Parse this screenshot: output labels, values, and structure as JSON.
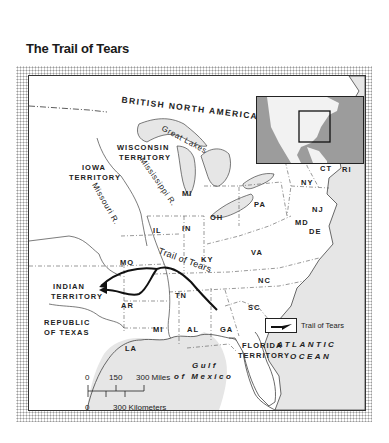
{
  "title": "The Trail of Tears",
  "inset_map": {
    "description": "North America locator map",
    "highlight": "Eastern United States"
  },
  "labels": {
    "country": "BRITISH NORTH AMERICA",
    "great_lakes": "Great Lakes",
    "wisconsin_1": "WISCONSIN",
    "wisconsin_2": "TERRITORY",
    "iowa_1": "IOWA",
    "iowa_2": "TERRITORY",
    "mississippi_river": "Mississippi R.",
    "missouri_river": "Missouri R.",
    "indian_1": "INDIAN",
    "indian_2": "TERRITORY",
    "texas_1": "REPUBLIC",
    "texas_2": "OF TEXAS",
    "florida_1": "FLORIDA",
    "florida_2": "TERRITORY",
    "atlantic_1": "ATLANTIC",
    "atlantic_2": "OCEAN",
    "gulf_1": "Gulf",
    "gulf_2": "of Mexico",
    "trail": "Trail of Tears"
  },
  "states": [
    "ME",
    "VT",
    "NH",
    "MA",
    "RI",
    "CT",
    "NY",
    "NJ",
    "PA",
    "DE",
    "MD",
    "MI",
    "OH",
    "IN",
    "IL",
    "MO",
    "KY",
    "VA",
    "NC",
    "TN",
    "SC",
    "GA",
    "AL",
    "MI",
    "AR",
    "LA"
  ],
  "legend": {
    "label": "Trail of Tears",
    "symbol": "arrow-line"
  },
  "scale": {
    "miles": [
      "0",
      "150",
      "300 Miles"
    ],
    "kilometers": [
      "0",
      "300 Kilometers"
    ]
  },
  "colors": {
    "water": "#e6e6e6",
    "land": "#ffffff",
    "border": "#333333",
    "route": "#111111",
    "inset_water": "#9c9c9c"
  }
}
